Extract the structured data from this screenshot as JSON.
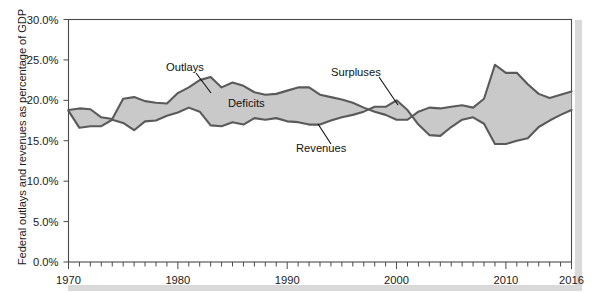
{
  "chart_data": {
    "type": "area",
    "title": "",
    "subtitle": "",
    "xlabel": "",
    "ylabel": "Federal outlays and revenues as percentage of GDP",
    "xlim": [
      1970,
      2016
    ],
    "ylim": [
      0,
      30
    ],
    "grid": false,
    "legend_position": "inline-annotations",
    "y_ticks": [
      "0.0%",
      "5.0%",
      "10.0%",
      "15.0%",
      "20.0%",
      "25.0%",
      "30.0%"
    ],
    "y_tick_values": [
      0,
      5,
      10,
      15,
      20,
      25,
      30
    ],
    "x_ticks": [
      "1970",
      "1980",
      "1990",
      "2000",
      "2010",
      "2016"
    ],
    "x_tick_values": [
      1970,
      1980,
      1990,
      2000,
      2010,
      2016
    ],
    "x_minor_tick_interval": 1,
    "x": [
      1970,
      1971,
      1972,
      1973,
      1974,
      1975,
      1976,
      1977,
      1978,
      1979,
      1980,
      1981,
      1982,
      1983,
      1984,
      1985,
      1986,
      1987,
      1988,
      1989,
      1990,
      1991,
      1992,
      1993,
      1994,
      1995,
      1996,
      1997,
      1998,
      1999,
      2000,
      2001,
      2002,
      2003,
      2004,
      2005,
      2006,
      2007,
      2008,
      2009,
      2010,
      2011,
      2012,
      2013,
      2014,
      2015,
      2016
    ],
    "series": [
      {
        "name": "Outlays",
        "color": "#5a5a5a",
        "values": [
          18.8,
          19.0,
          18.9,
          17.9,
          17.7,
          20.2,
          20.4,
          19.9,
          19.7,
          19.6,
          20.9,
          21.6,
          22.5,
          22.9,
          21.6,
          22.2,
          21.8,
          21.0,
          20.7,
          20.8,
          21.2,
          21.6,
          21.6,
          20.7,
          20.4,
          20.1,
          19.7,
          19.1,
          18.6,
          18.2,
          17.6,
          17.6,
          18.6,
          19.1,
          19.0,
          19.2,
          19.4,
          19.1,
          20.2,
          24.4,
          23.4,
          23.4,
          22.0,
          20.8,
          20.3,
          20.7,
          21.1
        ]
      },
      {
        "name": "Revenues",
        "color": "#5a5a5a",
        "values": [
          18.7,
          16.6,
          16.8,
          16.8,
          17.6,
          17.2,
          16.3,
          17.4,
          17.5,
          18.1,
          18.5,
          19.1,
          18.6,
          16.9,
          16.8,
          17.3,
          17.0,
          17.8,
          17.6,
          17.8,
          17.4,
          17.3,
          17.0,
          17.0,
          17.5,
          17.9,
          18.2,
          18.6,
          19.2,
          19.2,
          20.0,
          18.8,
          17.0,
          15.7,
          15.6,
          16.7,
          17.6,
          17.9,
          17.1,
          14.6,
          14.6,
          15.0,
          15.3,
          16.7,
          17.5,
          18.2,
          18.8
        ]
      }
    ],
    "annotations": [
      {
        "text": "Outlays",
        "x": 1980.2,
        "y": 25.2,
        "role": "series-callout"
      },
      {
        "text": "Deficits",
        "x": 1989.4,
        "y": 21.2,
        "role": "region-label"
      },
      {
        "text": "Surpluses",
        "x": 1997.7,
        "y": 24.6,
        "role": "region-callout"
      },
      {
        "text": "Revenues",
        "x": 1993.2,
        "y": 15.6,
        "role": "series-callout"
      }
    ],
    "region_fill_color": "#c9c9c9",
    "region_names": [
      "Deficits",
      "Surpluses"
    ]
  },
  "axis": {
    "y_label": "Federal outlays and revenues as percentage of GDP"
  }
}
